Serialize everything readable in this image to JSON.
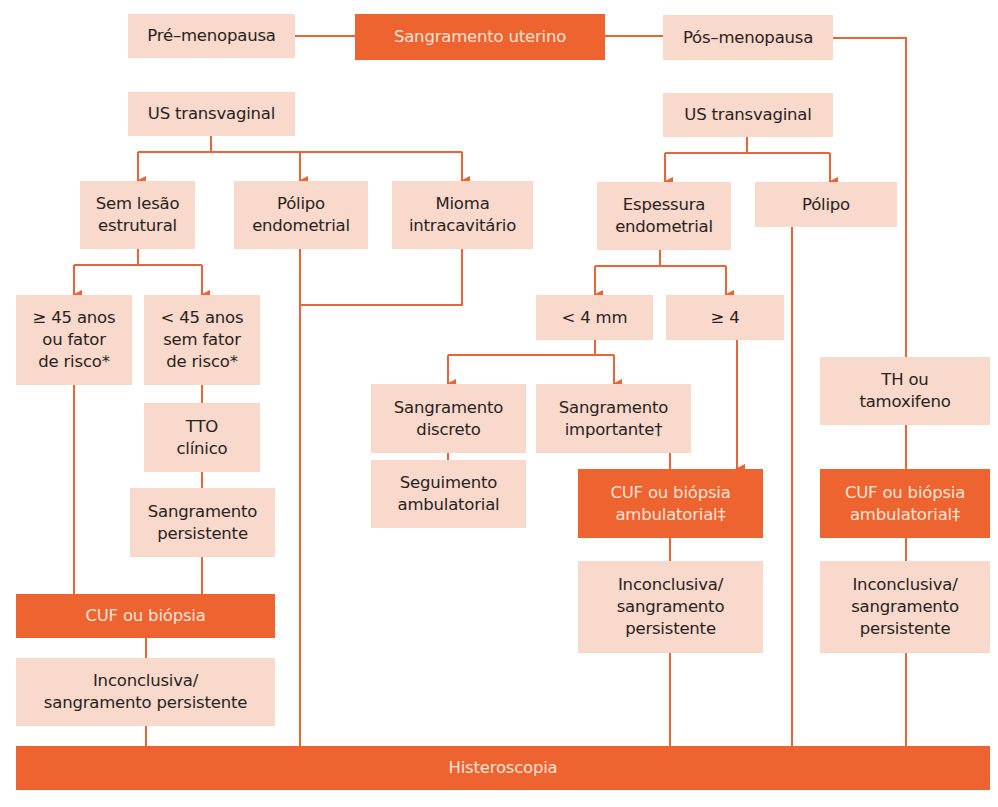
{
  "colors": {
    "light_box": "#f8d9cb",
    "dark_box": "#ee6430",
    "line": "#e8653a",
    "text": "#2a2220",
    "dark_text": "#fde3d6"
  },
  "nodes": {
    "pre_menopausa": "Pré–menopausa",
    "sangramento_uterino": "Sangramento uterino",
    "pos_menopausa": "Pós–menopausa",
    "us_transvaginal_pre": "US transvaginal",
    "us_transvaginal_pos": "US transvaginal",
    "sem_lesao": "Sem lesão\nestrutural",
    "polipo_endometrial": "Pólipo\nendometrial",
    "mioma": "Mioma\nintracavitário",
    "espessura": "Espessura\nendometrial",
    "polipo_pos": "Pólipo",
    "maior_45": "≥ 45 anos\nou fator\nde risco*",
    "menor_45": "< 45 anos\nsem fator\nde risco*",
    "menor_4mm": "< 4 mm",
    "maior_4": "≥ 4",
    "sangramento_discreto": "Sangramento\ndiscreto",
    "sangramento_importante": "Sangramento\nimportante†",
    "th_tamoxifeno": "TH ou\ntamoxifeno",
    "tto_clinico": "TTO\nclínico",
    "seguimento": "Seguimento\nambulatorial",
    "cuf_ambulatorial_mid": "CUF ou biópsia\nambulatorial‡",
    "cuf_ambulatorial_right": "CUF ou biópsia\nambulatorial‡",
    "sangramento_persistente": "Sangramento\npersistente",
    "cuf_biopsia_left": "CUF ou biópsia",
    "inconclusiva_left": "Inconclusiva/\nsangramento persistente",
    "inconclusiva_mid": "Inconclusiva/\nsangramento\npersistente",
    "inconclusiva_right": "Inconclusiva/\nsangramento\npersistente",
    "histeroscopia": "Histeroscopia"
  }
}
